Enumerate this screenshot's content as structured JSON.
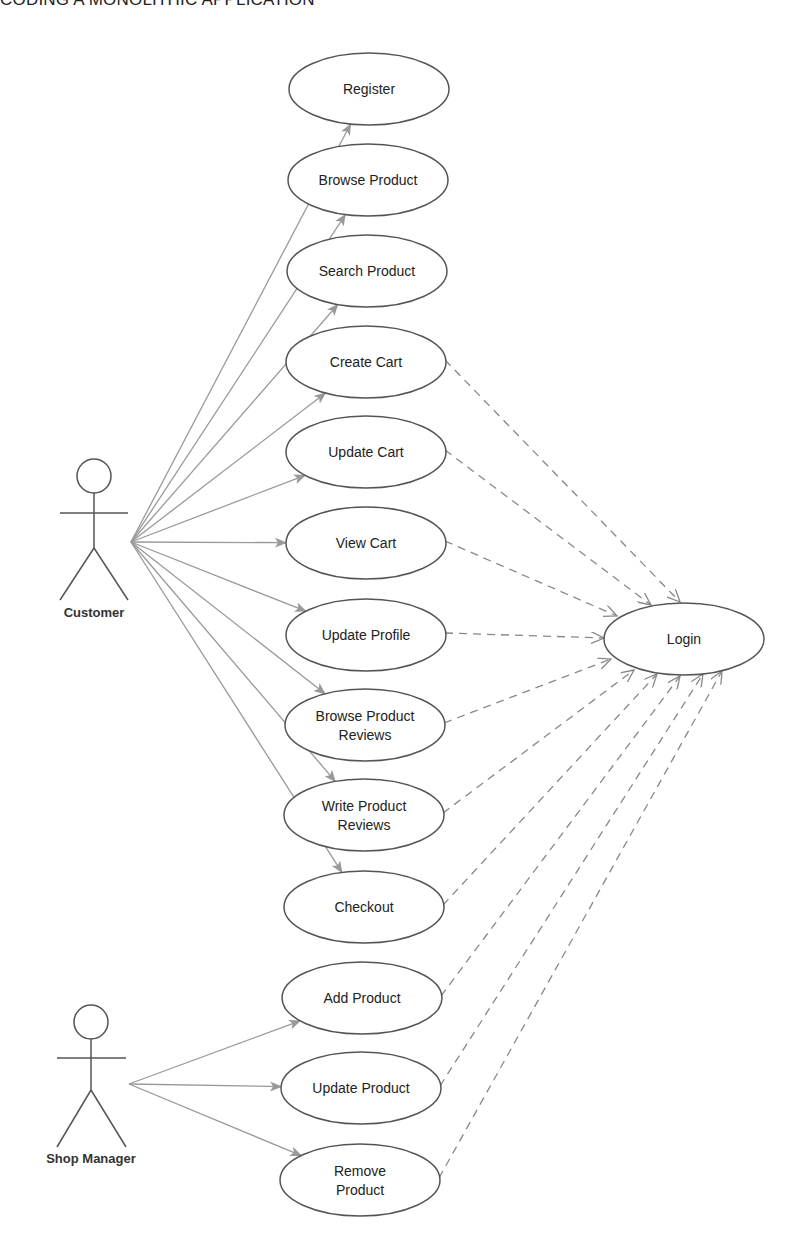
{
  "page": {
    "heading": "CODING A MONOLITHIC APPLICATION"
  },
  "colors": {
    "line": "#555555",
    "association_arrow": "#999999",
    "include_arrow": "#888888",
    "text": "#222222"
  },
  "actors": [
    {
      "id": "customer",
      "label": "Customer",
      "head": [
        94,
        476
      ],
      "arm_y": 513,
      "arm_x": [
        60,
        128
      ],
      "hip_y": 548,
      "feet_y": 600,
      "label_y": 617
    },
    {
      "id": "shop_manager",
      "label": "Shop Manager",
      "head": [
        91,
        1022
      ],
      "arm_y": 1058,
      "arm_x": [
        57,
        126
      ],
      "hip_y": 1090,
      "feet_y": 1147,
      "label_y": 1163
    }
  ],
  "use_cases": [
    {
      "id": "register",
      "lines": [
        "Register"
      ],
      "cx": 369,
      "cy": 89,
      "actor": "customer",
      "includes_login": false
    },
    {
      "id": "browse_product",
      "lines": [
        "Browse Product"
      ],
      "cx": 368,
      "cy": 180,
      "actor": "customer",
      "includes_login": false
    },
    {
      "id": "search_product",
      "lines": [
        "Search Product"
      ],
      "cx": 367,
      "cy": 271,
      "actor": "customer",
      "includes_login": false
    },
    {
      "id": "create_cart",
      "lines": [
        "Create Cart"
      ],
      "cx": 366,
      "cy": 362,
      "actor": "customer",
      "includes_login": true
    },
    {
      "id": "update_cart",
      "lines": [
        "Update Cart"
      ],
      "cx": 366,
      "cy": 452,
      "actor": "customer",
      "includes_login": true
    },
    {
      "id": "view_cart",
      "lines": [
        "View Cart"
      ],
      "cx": 366,
      "cy": 543,
      "actor": "customer",
      "includes_login": true
    },
    {
      "id": "update_profile",
      "lines": [
        "Update Profile"
      ],
      "cx": 366,
      "cy": 635,
      "actor": "customer",
      "includes_login": true
    },
    {
      "id": "browse_product_reviews",
      "lines": [
        "Browse Product",
        "Reviews"
      ],
      "cx": 365,
      "cy": 725,
      "actor": "customer",
      "includes_login": true
    },
    {
      "id": "write_product_reviews",
      "lines": [
        "Write Product",
        "Reviews"
      ],
      "cx": 364,
      "cy": 815,
      "actor": "customer",
      "includes_login": true
    },
    {
      "id": "checkout",
      "lines": [
        "Checkout"
      ],
      "cx": 364,
      "cy": 907,
      "actor": "customer",
      "includes_login": true
    },
    {
      "id": "add_product",
      "lines": [
        "Add Product"
      ],
      "cx": 362,
      "cy": 998,
      "actor": "shop_manager",
      "includes_login": true
    },
    {
      "id": "update_product",
      "lines": [
        "Update Product"
      ],
      "cx": 361,
      "cy": 1088,
      "actor": "shop_manager",
      "includes_login": true
    },
    {
      "id": "remove_product",
      "lines": [
        "Remove",
        "Product"
      ],
      "cx": 360,
      "cy": 1180,
      "actor": "shop_manager",
      "includes_login": true
    }
  ],
  "login": {
    "id": "login",
    "label": "Login",
    "cx": 684,
    "cy": 639,
    "rx": 80,
    "ry": 36
  },
  "login_arrow_targets": {
    "create_cart": [
      680,
      602
    ],
    "update_cart": [
      651,
      605
    ],
    "view_cart": [
      617,
      616
    ],
    "update_profile": [
      604,
      638
    ],
    "browse_product_reviews": [
      611,
      659
    ],
    "write_product_reviews": [
      634,
      670
    ],
    "checkout": [
      657,
      674
    ],
    "add_product": [
      680,
      676
    ],
    "update_product": [
      703,
      674
    ],
    "remove_product": [
      722,
      671
    ]
  }
}
